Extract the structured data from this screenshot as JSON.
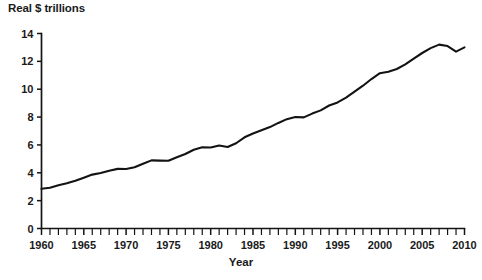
{
  "chart_data": {
    "type": "line",
    "title": "",
    "subtitle": "",
    "xlabel": "Year",
    "ylabel": "Real $ trillions",
    "xlim": [
      1960,
      2010
    ],
    "ylim": [
      0,
      14
    ],
    "grid": false,
    "legend": false,
    "legend_position": "none",
    "x_major_ticks": [
      1960,
      1965,
      1970,
      1975,
      1980,
      1985,
      1990,
      1995,
      2000,
      2005,
      2010
    ],
    "x_tick_labels": [
      "1960",
      "1965",
      "1970",
      "1975",
      "1980",
      "1985",
      "1990",
      "1995",
      "2000",
      "2005",
      "2010"
    ],
    "x_minor_tick_step": 1,
    "y_major_ticks": [
      0,
      2,
      4,
      6,
      8,
      10,
      12,
      14
    ],
    "y_tick_labels": [
      "0",
      "2",
      "4",
      "6",
      "8",
      "10",
      "12",
      "14"
    ],
    "series": [
      {
        "name": "Real GDP",
        "color": "#131313",
        "x": [
          1960,
          1961,
          1962,
          1963,
          1964,
          1965,
          1966,
          1967,
          1968,
          1969,
          1970,
          1971,
          1972,
          1973,
          1974,
          1975,
          1976,
          1977,
          1978,
          1979,
          1980,
          1981,
          1982,
          1983,
          1984,
          1985,
          1986,
          1987,
          1988,
          1989,
          1990,
          1991,
          1992,
          1993,
          1994,
          1995,
          1996,
          1997,
          1998,
          1999,
          2000,
          2001,
          2002,
          2003,
          2004,
          2005,
          2006,
          2007,
          2008,
          2009,
          2010
        ],
        "values": [
          2.85,
          2.93,
          3.1,
          3.25,
          3.43,
          3.65,
          3.87,
          3.98,
          4.15,
          4.28,
          4.27,
          4.4,
          4.65,
          4.89,
          4.87,
          4.86,
          5.12,
          5.35,
          5.65,
          5.83,
          5.82,
          5.96,
          5.85,
          6.12,
          6.55,
          6.82,
          7.05,
          7.28,
          7.58,
          7.85,
          8.0,
          7.98,
          8.25,
          8.48,
          8.83,
          9.05,
          9.4,
          9.82,
          10.25,
          10.73,
          11.15,
          11.25,
          11.45,
          11.78,
          12.2,
          12.6,
          12.95,
          13.2,
          13.1,
          12.7,
          13.0
        ]
      }
    ]
  },
  "axes": {
    "y_axis_name": "value-axis",
    "x_axis_name": "year-axis"
  }
}
